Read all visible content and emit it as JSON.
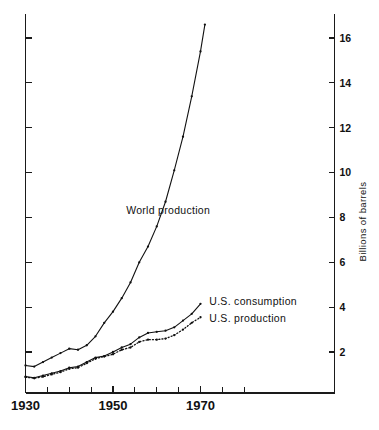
{
  "chart_data": {
    "type": "line",
    "title": "",
    "xlabel": "",
    "ylabel": "Billions of barrels",
    "xlim": [
      1930,
      1982
    ],
    "ylim": [
      0,
      17
    ],
    "grid": false,
    "legend_position": "inline-annotation",
    "x_ticks_major": [
      1930,
      1950,
      1970
    ],
    "x_ticks_minor": [
      1935,
      1940,
      1945,
      1955,
      1960,
      1965,
      1975,
      1980
    ],
    "x_tick_labels": [
      "1930",
      "1950",
      "1970"
    ],
    "y_ticks": [
      2,
      4,
      6,
      8,
      10,
      12,
      14,
      16
    ],
    "y_tick_labels": [
      "2",
      "4",
      "6",
      "8",
      "10",
      "12",
      "14",
      "16"
    ],
    "series": [
      {
        "name": "World production",
        "style": "solid",
        "label": "World production",
        "label_x": 1953,
        "label_y": 8.3,
        "x": [
          1930,
          1932,
          1934,
          1936,
          1938,
          1940,
          1942,
          1944,
          1946,
          1948,
          1950,
          1952,
          1954,
          1956,
          1958,
          1960,
          1962,
          1964,
          1966,
          1968,
          1970,
          1971
        ],
        "y": [
          1.4,
          1.35,
          1.55,
          1.75,
          1.95,
          2.15,
          2.1,
          2.3,
          2.7,
          3.3,
          3.8,
          4.4,
          5.1,
          6.0,
          6.7,
          7.6,
          8.7,
          10.1,
          11.6,
          13.4,
          15.4,
          16.6
        ]
      },
      {
        "name": "U.S. consumption",
        "style": "solid",
        "label": "U.S. consumption",
        "label_x": 1972,
        "label_y": 4.25,
        "x": [
          1930,
          1932,
          1934,
          1936,
          1938,
          1940,
          1942,
          1944,
          1946,
          1948,
          1950,
          1952,
          1954,
          1956,
          1958,
          1960,
          1962,
          1964,
          1966,
          1968,
          1970
        ],
        "y": [
          0.9,
          0.85,
          0.95,
          1.05,
          1.15,
          1.3,
          1.35,
          1.55,
          1.75,
          1.82,
          2.0,
          2.2,
          2.35,
          2.65,
          2.85,
          2.9,
          2.95,
          3.1,
          3.4,
          3.7,
          4.15
        ]
      },
      {
        "name": "U.S. production",
        "style": "dotted",
        "label": "U.S. production",
        "label_x": 1972,
        "label_y": 3.5,
        "x": [
          1930,
          1932,
          1934,
          1936,
          1938,
          1940,
          1942,
          1944,
          1946,
          1948,
          1950,
          1952,
          1954,
          1956,
          1958,
          1960,
          1962,
          1964,
          1966,
          1968,
          1970
        ],
        "y": [
          0.88,
          0.83,
          0.9,
          1.0,
          1.1,
          1.25,
          1.3,
          1.5,
          1.7,
          1.8,
          1.9,
          2.1,
          2.2,
          2.45,
          2.55,
          2.55,
          2.6,
          2.75,
          3.0,
          3.3,
          3.55
        ]
      }
    ],
    "colors": {
      "ink": "#111111",
      "background": "#ffffff"
    }
  }
}
